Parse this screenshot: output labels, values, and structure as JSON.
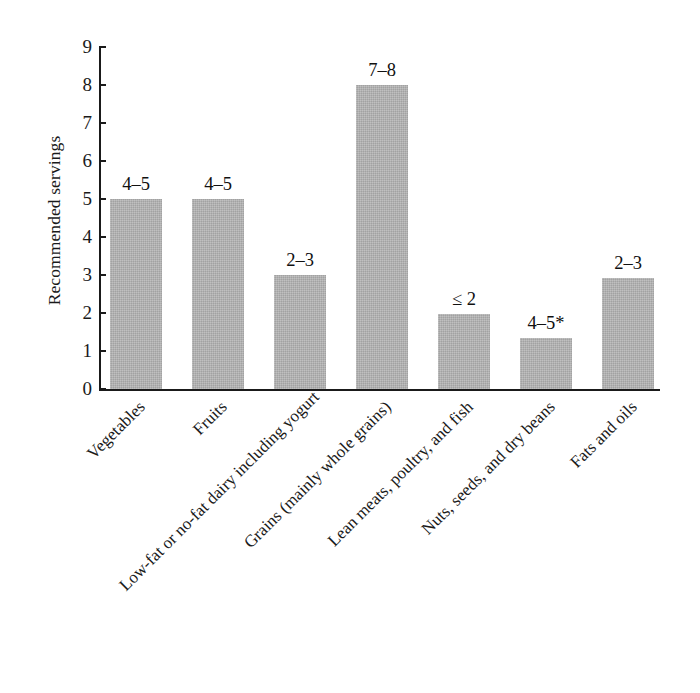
{
  "chart_data": {
    "type": "bar",
    "title": "",
    "xlabel": "",
    "ylabel": "Recommended servings",
    "ylim": [
      0,
      9
    ],
    "ytick_labels": [
      "0",
      "1",
      "2",
      "3",
      "4",
      "5",
      "6",
      "7",
      "8",
      "9"
    ],
    "grid": false,
    "legend": "none",
    "bar_color": "#b2b2b2",
    "categories": [
      "Vegetables",
      "Fruits",
      "Low-fat or no-fat dairy including yogurt",
      "Grains (mainly whole grains)",
      "Lean meats, poultry, and fish",
      "Nuts, seeds, and dry beans",
      "Fats and oils"
    ],
    "values": [
      5.0,
      5.0,
      3.0,
      8.0,
      1.97,
      1.34,
      2.92
    ],
    "data_labels": [
      "4–5",
      "4–5",
      "2–3",
      "7–8",
      "≤ 2",
      "4–5*",
      "2–3"
    ]
  }
}
